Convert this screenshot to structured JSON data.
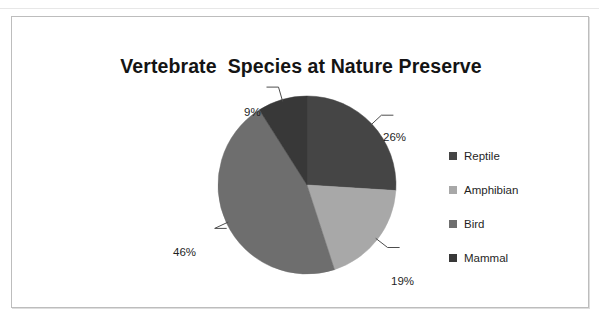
{
  "chart_data": {
    "type": "pie",
    "title": "Vertebrate  Species at Nature Preserve",
    "categories": [
      "Reptile",
      "Amphibian",
      "Bird",
      "Mammal"
    ],
    "values": [
      26,
      19,
      46,
      9
    ],
    "value_labels": [
      "26%",
      "19%",
      "46%",
      "9%"
    ],
    "units": "percent",
    "total": 100,
    "legend_position": "right",
    "grid": false,
    "xlabel": "",
    "ylabel": "",
    "colors": [
      "#454545",
      "#a8a8a8",
      "#6e6e6e",
      "#383838"
    ],
    "start_angle_deg": 0,
    "direction": "clockwise",
    "slices": [
      {
        "label": "Reptile",
        "value": 26,
        "display": "26%",
        "color": "#454545"
      },
      {
        "label": "Amphibian",
        "value": 19,
        "display": "19%",
        "color": "#a8a8a8"
      },
      {
        "label": "Bird",
        "value": 46,
        "display": "46%",
        "color": "#6e6e6e"
      },
      {
        "label": "Mammal",
        "value": 9,
        "display": "9%",
        "color": "#383838"
      }
    ]
  },
  "frame": {
    "border_color": "#bdbdbd"
  }
}
